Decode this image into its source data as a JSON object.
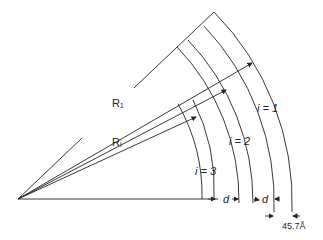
{
  "diagram": {
    "type": "concentric-arc-sector",
    "origin": [
      18,
      199
    ],
    "stroke_color": "#222222",
    "background": "#ffffff",
    "labels": {
      "outer_radius": "R₁",
      "inner_radius": "Rᵢ",
      "shell_1": "i = 1",
      "shell_2": "i = 2",
      "shell_3": "i = 3",
      "spacing_1": "d",
      "spacing_2": "d",
      "thickness": "45.7Å"
    },
    "shells": [
      {
        "index": 1,
        "radii": [
          256,
          274
        ]
      },
      {
        "index": 2,
        "radii": [
          221,
          235
        ]
      },
      {
        "index": 3,
        "radii": [
          184,
          196
        ]
      }
    ]
  }
}
